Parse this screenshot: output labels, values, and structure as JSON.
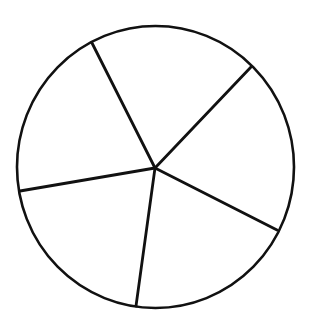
{
  "figure": {
    "canvas": {
      "width": 309,
      "height": 322
    },
    "background_color": "#ffffff",
    "stroke_color": "#111111",
    "circle": {
      "cx": 155.5,
      "cy": 167,
      "rx": 138.5,
      "ry": 141
    },
    "hub": {
      "x": 155,
      "y": 168
    },
    "dividers": [
      {
        "name": "top-left",
        "x": 92,
        "y": 43
      },
      {
        "name": "top-right",
        "x": 251,
        "y": 67
      },
      {
        "name": "right",
        "x": 277,
        "y": 230
      },
      {
        "name": "bottom",
        "x": 136,
        "y": 306
      },
      {
        "name": "left",
        "x": 20,
        "y": 191
      }
    ],
    "sector_count": 5,
    "approx_sector_angles_deg": [
      70,
      73,
      72,
      71,
      74
    ]
  }
}
